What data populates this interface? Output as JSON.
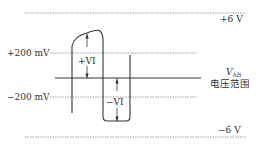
{
  "diagram": {
    "levels": {
      "pos_rail": "+6 V",
      "neg_rail": "−6 V",
      "pos_threshold": "+200 mV",
      "neg_threshold": "−200 mV"
    },
    "annotations": {
      "pos_vi": "+VI",
      "neg_vi": "−VI"
    },
    "axis_label": {
      "v": "V",
      "sub": "AB",
      "range": "电压范围"
    },
    "colors": {
      "line": "#333333",
      "dashed": "#888888"
    }
  }
}
